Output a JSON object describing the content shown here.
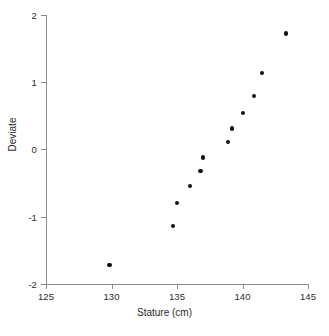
{
  "chart_data": {
    "type": "scatter",
    "title": "",
    "xlabel": "Stature (cm)",
    "ylabel": "Deviate",
    "xlim": [
      125,
      145
    ],
    "ylim": [
      -2,
      2
    ],
    "xticks": [
      125,
      130,
      135,
      140,
      145
    ],
    "yticks": [
      2,
      1,
      0,
      -1,
      -2
    ],
    "xtick_labels": [
      "125",
      "130",
      "135",
      "140",
      "145"
    ],
    "ytick_labels": [
      "2",
      "1",
      "0",
      "-1",
      "-2"
    ],
    "grid": false,
    "legend": false,
    "marker": "filled-circle",
    "marker_color": "#111111",
    "axis_color": "#8a8a8a",
    "points": [
      {
        "x": 129.85,
        "y": -1.72
      },
      {
        "x": 134.7,
        "y": -1.14
      },
      {
        "x": 135.0,
        "y": -0.8
      },
      {
        "x": 136.0,
        "y": -0.55
      },
      {
        "x": 136.8,
        "y": -0.32
      },
      {
        "x": 137.0,
        "y": -0.12
      },
      {
        "x": 138.9,
        "y": 0.11
      },
      {
        "x": 139.2,
        "y": 0.31
      },
      {
        "x": 140.05,
        "y": 0.54
      },
      {
        "x": 140.9,
        "y": 0.79
      },
      {
        "x": 141.5,
        "y": 1.13
      },
      {
        "x": 143.35,
        "y": 1.72
      }
    ],
    "x": [
      129.85,
      134.7,
      135.0,
      136.0,
      136.8,
      137.0,
      138.9,
      139.2,
      140.05,
      140.9,
      141.5,
      143.35
    ],
    "values": [
      -1.72,
      -1.14,
      -0.8,
      -0.55,
      -0.32,
      -0.12,
      0.11,
      0.31,
      0.54,
      0.79,
      1.13,
      1.72
    ]
  }
}
